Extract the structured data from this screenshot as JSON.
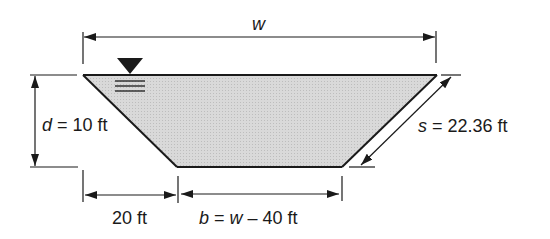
{
  "diagram": {
    "colors": {
      "fill": "#d6d6d6",
      "stroke": "#1a1a1a",
      "background": "#ffffff"
    },
    "labels": {
      "top_width_var": "w",
      "depth_var": "d",
      "depth_value": " = 10 ft",
      "side_var": "s",
      "side_value": " = 22.36 ft",
      "horizontal_offset": "20 ft",
      "bottom_width_var": "b",
      "bottom_width_eq": " = ",
      "bottom_width_w": "w",
      "bottom_width_rest": " – 40 ft"
    },
    "symbols": {
      "water_surface": "water-surface-triangle-icon"
    },
    "dimensions": {
      "top_width": "w",
      "depth_ft": 10,
      "side_length_ft": 22.36,
      "horizontal_offset_ft": 20,
      "bottom_width": "w - 40 ft"
    }
  }
}
